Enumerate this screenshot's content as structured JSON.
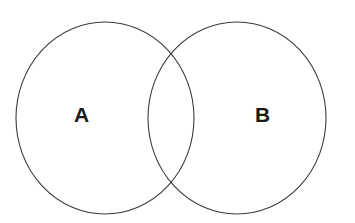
{
  "diagram": {
    "type": "venn-two-set",
    "background_color": "#ffffff",
    "stroke_color": "#3b3b3b",
    "label_color": "#1a1a1a",
    "sets": [
      {
        "id": "a",
        "label": "A",
        "icon_name": "circle-outline-icon",
        "center_x": 105,
        "center_y": 118,
        "radius_x": 89,
        "radius_y": 96
      },
      {
        "id": "b",
        "label": "B",
        "icon_name": "circle-outline-icon",
        "center_x": 237,
        "center_y": 118,
        "radius_x": 89,
        "radius_y": 96
      }
    ],
    "intersection": {
      "upper_point_x": 171,
      "upper_point_y": 48,
      "lower_point_x": 171,
      "lower_point_y": 188,
      "label": ""
    }
  }
}
